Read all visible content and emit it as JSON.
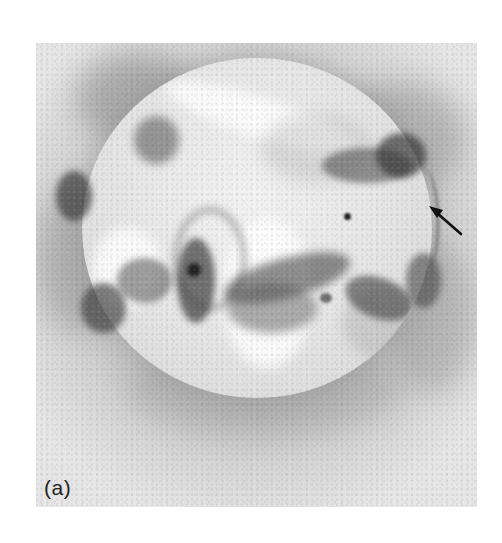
{
  "figure": {
    "panel_label": "(a)",
    "annotation": {
      "type": "arrow",
      "icon": "arrow-icon",
      "direction": "pointing up-left toward the north-west limb"
    },
    "colors": {
      "background": "#ffffff",
      "corona": "#c4c4c4",
      "disk": "#ececec",
      "active_region": "#4a4a4a",
      "arrow": "#111111",
      "label": "#222222"
    }
  }
}
